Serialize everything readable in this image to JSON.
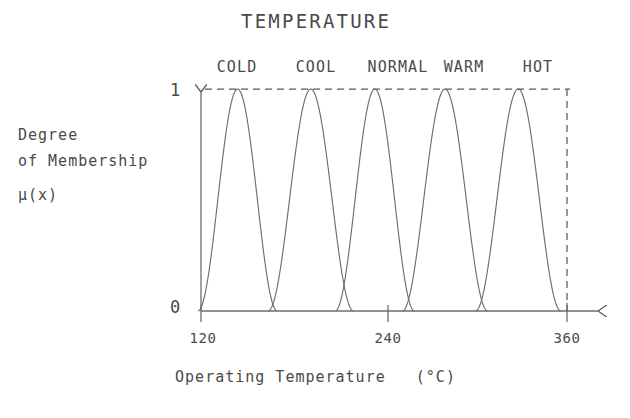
{
  "chart_data": {
    "type": "line",
    "title": "TEMPERATURE",
    "xlabel": "Operating Temperature   (°C)",
    "ylabel_lines": [
      "Degree",
      "of Membership",
      "μ(x)"
    ],
    "xlim": [
      120,
      360
    ],
    "ylim": [
      0,
      1
    ],
    "xticks": [
      120,
      240,
      360
    ],
    "xtick_labels": [
      "120",
      "240",
      "360"
    ],
    "yticks": [
      0,
      1
    ],
    "ytick_labels": [
      "0",
      "1"
    ],
    "grid": false,
    "legend": "inline-above-peaks",
    "annotations": [
      "dashed horizontal reference line at mu = 1",
      "dashed vertical reference line at x = 360",
      "y-axis drawn as upward arrow",
      "x-axis drawn as rightward arrow"
    ],
    "series": [
      {
        "name": "COLD",
        "label_x": 240,
        "center": 144,
        "half_width": 26,
        "shape": "bell",
        "points_x": [
          118,
          124,
          130,
          136,
          142,
          148,
          154,
          160,
          166,
          172
        ],
        "points_y": [
          0.0,
          0.05,
          0.35,
          0.8,
          1.0,
          0.95,
          0.62,
          0.22,
          0.03,
          0.0
        ]
      },
      {
        "name": "COOL",
        "label_x": 290,
        "center": 192,
        "half_width": 28,
        "shape": "bell",
        "points_x": [
          162,
          170,
          178,
          186,
          192,
          198,
          206,
          214,
          222
        ],
        "points_y": [
          0.0,
          0.18,
          0.62,
          0.95,
          1.0,
          0.95,
          0.62,
          0.18,
          0.0
        ]
      },
      {
        "name": "NORMAL",
        "label_x": 350,
        "center": 234,
        "half_width": 26,
        "shape": "bell",
        "points_x": [
          206,
          214,
          222,
          228,
          234,
          240,
          246,
          254,
          262
        ],
        "points_y": [
          0.0,
          0.2,
          0.68,
          0.92,
          1.0,
          0.92,
          0.68,
          0.2,
          0.0
        ]
      },
      {
        "name": "WARM",
        "label_x": 410,
        "center": 280,
        "half_width": 28,
        "shape": "bell",
        "points_x": [
          250,
          258,
          266,
          274,
          280,
          286,
          294,
          302,
          310
        ],
        "points_y": [
          0.0,
          0.18,
          0.62,
          0.95,
          1.0,
          0.95,
          0.62,
          0.18,
          0.0
        ]
      },
      {
        "name": "HOT",
        "label_x": 470,
        "center": 328,
        "half_width": 28,
        "shape": "bell",
        "points_x": [
          296,
          306,
          314,
          322,
          328,
          334,
          342,
          350,
          358
        ],
        "points_y": [
          0.0,
          0.16,
          0.58,
          0.92,
          1.0,
          0.98,
          0.78,
          0.32,
          0.02
        ]
      }
    ],
    "crossings": [
      {
        "between": [
          "COLD",
          "COOL"
        ],
        "x": 168,
        "mu": 0.48
      },
      {
        "between": [
          "COOL",
          "NORMAL"
        ],
        "x": 214,
        "mu": 0.62
      },
      {
        "between": [
          "NORMAL",
          "WARM"
        ],
        "x": 258,
        "mu": 0.6
      },
      {
        "between": [
          "WARM",
          "HOT"
        ],
        "x": 304,
        "mu": 0.55
      }
    ]
  },
  "colors": {
    "ink": "#4a4a4a",
    "curve": "#6e6e6e",
    "axis": "#6e6e6e",
    "dash": "#5a5a5a",
    "background": "#ffffff"
  }
}
